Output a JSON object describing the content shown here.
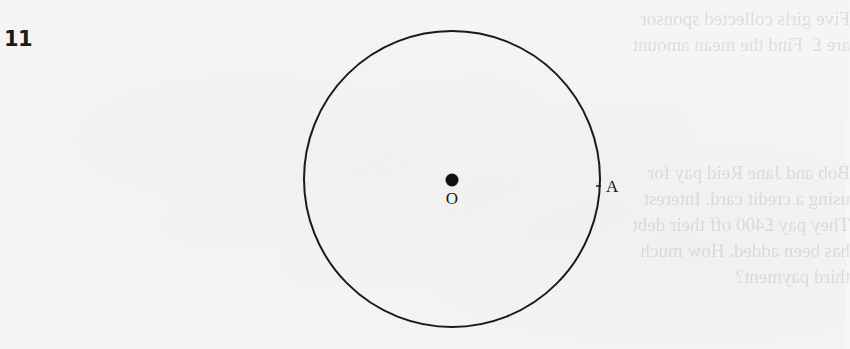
{
  "question": {
    "number": "11"
  },
  "figure": {
    "type": "circle-diagram",
    "circle": {
      "cx": 452,
      "cy": 179,
      "r": 148,
      "stroke": "#1a1a1a"
    },
    "centre_point": {
      "label": "O",
      "x": 452,
      "y": 180
    },
    "circumference_point": {
      "label": "A",
      "x": 599,
      "y": 186
    }
  }
}
